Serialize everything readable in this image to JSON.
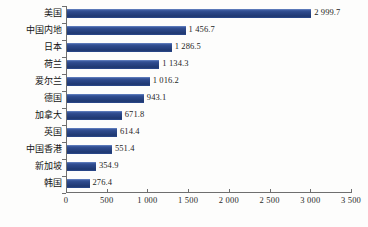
{
  "chart_data": {
    "type": "bar",
    "orientation": "horizontal",
    "title": "",
    "xlabel": "",
    "ylabel": "",
    "xlim": [
      0,
      3500
    ],
    "grid": false,
    "legend": null,
    "categories": [
      "美国",
      "中国内地",
      "日本",
      "荷兰",
      "爱尔兰",
      "德国",
      "加拿大",
      "英国",
      "中国香港",
      "新加坡",
      "韩国"
    ],
    "values": [
      2999.7,
      1456.7,
      1286.5,
      1134.3,
      1016.2,
      943.1,
      671.8,
      614.4,
      551.4,
      354.9,
      276.4
    ],
    "value_labels": [
      "2 999.7",
      "1 456.7",
      "1 286.5",
      "1 134.3",
      "1 016.2",
      "943.1",
      "671.8",
      "614.4",
      "551.4",
      "354.9",
      "276.4"
    ],
    "xticks": [
      0,
      500,
      1000,
      1500,
      2000,
      2500,
      3000,
      3500
    ],
    "xtick_labels": [
      "0",
      "500",
      "1 000",
      "1 500",
      "2 000",
      "2 500",
      "3 000",
      "3 500"
    ],
    "series": [
      {
        "name": "",
        "color": "#2b4b8c",
        "values": [
          2999.7,
          1456.7,
          1286.5,
          1134.3,
          1016.2,
          943.1,
          671.8,
          614.4,
          551.4,
          354.9,
          276.4
        ]
      }
    ]
  },
  "caption": {
    "text": ""
  }
}
